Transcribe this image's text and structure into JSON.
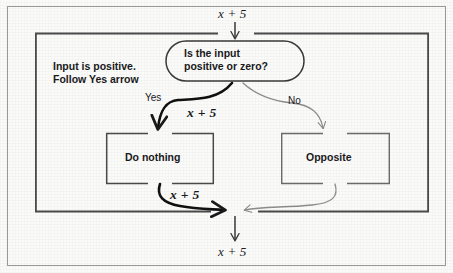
{
  "diagram": {
    "input_expression": "x + 5",
    "output_expression": "x + 5",
    "annotation_line1": "Input is positive.",
    "annotation_line2": "Follow Yes arrow",
    "decision": {
      "line1": "Is the input",
      "line2": "positive or zero?"
    },
    "branches": {
      "yes_label": "Yes",
      "no_label": "No",
      "yes_value": "x + 5",
      "yes_result_value": "x + 5"
    },
    "process_yes": "Do nothing",
    "process_no": "Opposite",
    "colors": {
      "background": "#fbfbfa",
      "stroke_dark": "#1a1a1a",
      "stroke_light": "#8a8a8a",
      "stroke_frame": "#555555",
      "text": "#1a1a1a"
    }
  }
}
